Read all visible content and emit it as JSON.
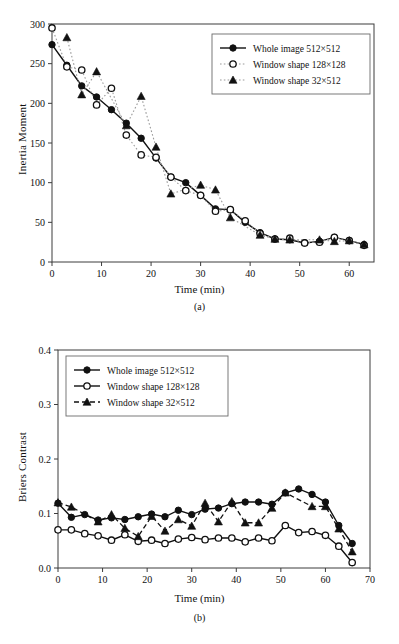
{
  "figure": {
    "panels": [
      {
        "id": "a",
        "caption": "(a)",
        "ylabel": "Inertia Moment",
        "xlabel": "Time (min)"
      },
      {
        "id": "b",
        "caption": "(b)",
        "ylabel": "Briers Contrast",
        "xlabel": "Time (min)"
      }
    ]
  },
  "chart_data": [
    {
      "type": "line",
      "panel": "(a)",
      "title": "",
      "xlabel": "Time (min)",
      "ylabel": "Inertia Moment",
      "xlim": [
        0,
        65
      ],
      "ylim": [
        0,
        300
      ],
      "xticks": [
        0,
        10,
        20,
        30,
        40,
        50,
        60
      ],
      "yticks": [
        0,
        50,
        100,
        150,
        200,
        250,
        300
      ],
      "xticklabels": [
        "0",
        "10",
        "20",
        "30",
        "40",
        "50",
        "60"
      ],
      "yticklabels": [
        "0",
        "50",
        "100",
        "150",
        "200",
        "250",
        "300"
      ],
      "grid": false,
      "legend_position": "upper right",
      "series": [
        {
          "name": "Whole image 512×512",
          "marker": "filled-circle",
          "line": "solid",
          "x": [
            0,
            3,
            6,
            9,
            12,
            15,
            18,
            21,
            24,
            27,
            30,
            33,
            36,
            39,
            42,
            45,
            48,
            51,
            54,
            57,
            60,
            63
          ],
          "y": [
            274,
            248,
            222,
            208,
            192,
            175,
            156,
            131,
            107,
            100,
            84,
            67,
            66,
            50,
            37,
            29,
            28,
            24,
            26,
            31,
            27,
            22
          ]
        },
        {
          "name": "Window shape 128×128",
          "marker": "open-circle",
          "line": "dotted",
          "x": [
            0,
            3,
            6,
            9,
            12,
            15,
            18,
            21,
            24,
            27,
            30,
            33,
            36,
            39,
            42,
            45,
            48,
            51,
            54,
            57,
            60,
            63
          ],
          "y": [
            295,
            246,
            242,
            198,
            219,
            160,
            135,
            132,
            107,
            90,
            84,
            64,
            66,
            52,
            36,
            29,
            30,
            24,
            25,
            31,
            27,
            21
          ]
        },
        {
          "name": "Window shape 32×512",
          "marker": "filled-triangle",
          "line": "dotted",
          "x": [
            3,
            6,
            9,
            15,
            18,
            21,
            24,
            30,
            33,
            36,
            42,
            45,
            48,
            54,
            57,
            60,
            63
          ],
          "y": [
            283,
            211,
            240,
            172,
            209,
            145,
            86,
            97,
            91,
            56,
            34,
            29,
            28,
            28,
            26,
            27,
            22
          ]
        }
      ]
    },
    {
      "type": "line",
      "panel": "(b)",
      "title": "",
      "xlabel": "Time (min)",
      "ylabel": "Briers Contrast",
      "xlim": [
        0,
        70
      ],
      "ylim": [
        0.0,
        0.4
      ],
      "xticks": [
        0,
        10,
        20,
        30,
        40,
        50,
        60,
        70
      ],
      "yticks": [
        0.0,
        0.1,
        0.2,
        0.3,
        0.4
      ],
      "xticklabels": [
        "0",
        "10",
        "20",
        "30",
        "40",
        "50",
        "60",
        "70"
      ],
      "yticklabels": [
        "0.0",
        "0.1",
        "0.2",
        "0.3",
        "0.4"
      ],
      "grid": false,
      "legend_position": "upper left",
      "series": [
        {
          "name": "Whole image 512×512",
          "marker": "filled-circle",
          "line": "solid",
          "x": [
            0,
            3,
            6,
            9,
            12,
            15,
            18,
            21,
            24,
            27,
            30,
            33,
            36,
            39,
            42,
            45,
            48,
            51,
            54,
            57,
            60,
            63,
            66
          ],
          "y": [
            0.119,
            0.093,
            0.098,
            0.088,
            0.092,
            0.089,
            0.094,
            0.099,
            0.094,
            0.106,
            0.098,
            0.108,
            0.11,
            0.118,
            0.121,
            0.121,
            0.117,
            0.138,
            0.145,
            0.135,
            0.121,
            0.078,
            0.045
          ]
        },
        {
          "name": "Window shape 128×128",
          "marker": "open-circle",
          "line": "solid",
          "x": [
            0,
            3,
            6,
            9,
            12,
            15,
            18,
            21,
            24,
            27,
            30,
            33,
            36,
            39,
            42,
            45,
            48,
            51,
            54,
            57,
            60,
            63,
            66
          ],
          "y": [
            0.07,
            0.07,
            0.063,
            0.059,
            0.051,
            0.061,
            0.049,
            0.051,
            0.045,
            0.053,
            0.056,
            0.052,
            0.055,
            0.055,
            0.048,
            0.055,
            0.05,
            0.078,
            0.065,
            0.067,
            0.06,
            0.04,
            0.01
          ]
        },
        {
          "name": "Window shape 32×512",
          "marker": "filled-triangle",
          "line": "dashed",
          "x": [
            0,
            3,
            9,
            12,
            15,
            18,
            21,
            24,
            27,
            30,
            33,
            36,
            39,
            42,
            45,
            48,
            51,
            57,
            60,
            63,
            66
          ],
          "y": [
            0.12,
            0.112,
            0.085,
            0.098,
            0.073,
            0.058,
            0.095,
            0.068,
            0.089,
            0.077,
            0.119,
            0.085,
            0.122,
            0.083,
            0.083,
            0.11,
            0.138,
            0.113,
            0.113,
            0.072,
            0.03
          ]
        }
      ]
    }
  ]
}
